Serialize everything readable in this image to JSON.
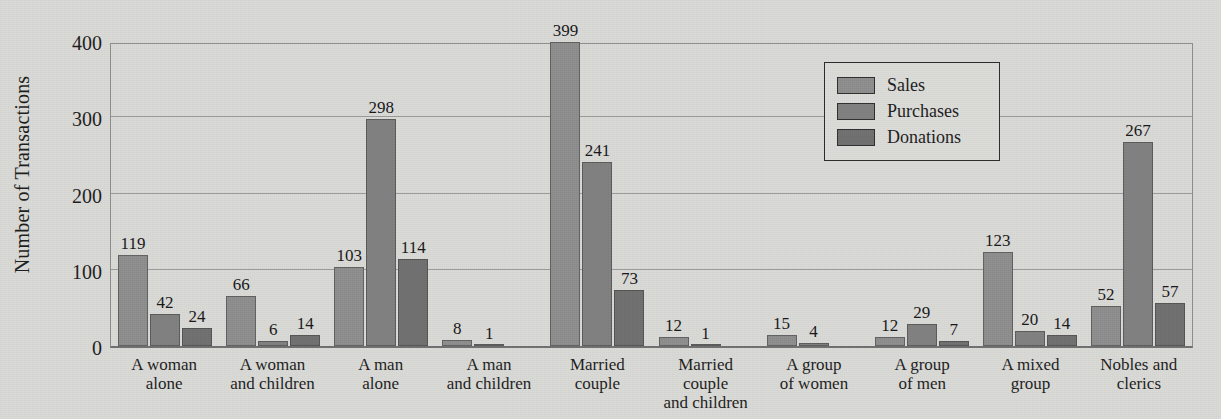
{
  "chart_data": {
    "type": "bar",
    "title": "",
    "xlabel": "",
    "ylabel": "Number of Transactions",
    "ylim": [
      0,
      400
    ],
    "yticks": [
      0,
      100,
      200,
      300,
      400
    ],
    "grid": true,
    "legend_position": "top-right",
    "categories": [
      "A woman\nalone",
      "A woman\nand children",
      "A man\nalone",
      "A man\nand children",
      "Married\ncouple",
      "Married\ncouple\nand children",
      "A group\nof women",
      "A group\nof men",
      "A mixed\ngroup",
      "Nobles and\nclerics"
    ],
    "series": [
      {
        "name": "Sales",
        "color": "#8d8d8d",
        "values": [
          119,
          66,
          103,
          8,
          399,
          12,
          15,
          12,
          123,
          52
        ]
      },
      {
        "name": "Purchases",
        "color": "#7f7f7f",
        "values": [
          42,
          6,
          298,
          1,
          241,
          1,
          4,
          29,
          20,
          267
        ]
      },
      {
        "name": "Donations",
        "color": "#6f6f6f",
        "values": [
          24,
          14,
          114,
          0,
          73,
          0,
          0,
          7,
          14,
          57
        ]
      }
    ],
    "value_labels": [
      [
        "119",
        "42",
        "24"
      ],
      [
        "66",
        "6",
        "14"
      ],
      [
        "103",
        "298",
        "114"
      ],
      [
        "8",
        "1",
        ""
      ],
      [
        "399",
        "241",
        "73"
      ],
      [
        "12",
        "1",
        ""
      ],
      [
        "15",
        "4",
        ""
      ],
      [
        "12",
        "29",
        "7"
      ],
      [
        "123",
        "20",
        "14"
      ],
      [
        "52",
        "267",
        "57"
      ]
    ]
  },
  "legend": {
    "items": [
      {
        "label": "Sales"
      },
      {
        "label": "Purchases"
      },
      {
        "label": "Donations"
      }
    ]
  },
  "axis": {
    "y_title": "Number of Transactions",
    "y_ticks": [
      "400",
      "300",
      "200",
      "100",
      "0"
    ]
  }
}
